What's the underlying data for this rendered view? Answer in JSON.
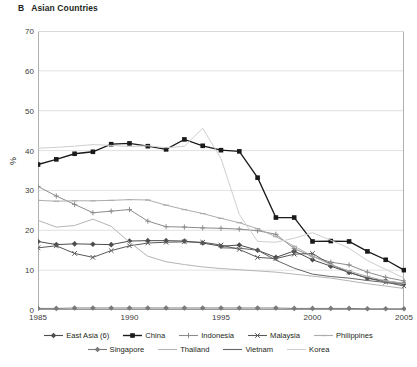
{
  "panel": {
    "letter": "B",
    "title": "Asian Countries"
  },
  "chart_data": {
    "type": "line",
    "title": "Asian Countries",
    "xlabel": "",
    "ylabel": "%",
    "xlim": [
      1985,
      2005
    ],
    "ylim": [
      0,
      70
    ],
    "ytick_values": [
      0,
      10,
      20,
      30,
      40,
      50,
      60,
      70
    ],
    "xtick_values": [
      1985,
      1990,
      1995,
      2000,
      2005
    ],
    "xtick_labels": [
      "1985",
      "1990",
      "1995",
      "2000",
      "2005"
    ],
    "grid": "horizontal",
    "legend_position": "bottom",
    "x": [
      1985,
      1986,
      1987,
      1988,
      1989,
      1990,
      1991,
      1992,
      1993,
      1994,
      1995,
      1996,
      1997,
      1998,
      1999,
      2000,
      2001,
      2002,
      2003,
      2004,
      2005
    ],
    "series": [
      {
        "name": "East Asia (6)",
        "color": "#4d4d4d",
        "marker": "diamond",
        "values": [
          17.2,
          16.4,
          16.6,
          16.5,
          16.4,
          17.3,
          17.4,
          17.4,
          17.3,
          16.8,
          16.0,
          16.3,
          15.0,
          13.2,
          14.8,
          12.6,
          11.0,
          9.4,
          8.0,
          7.3,
          6.6
        ]
      },
      {
        "name": "China",
        "color": "#1a1a1a",
        "marker": "square",
        "values": [
          36.5,
          37.8,
          39.2,
          39.7,
          41.6,
          41.8,
          41.1,
          40.3,
          42.8,
          41.2,
          40.1,
          39.8,
          33.2,
          23.2,
          23.2,
          17.2,
          17.3,
          17.2,
          14.7,
          12.6,
          10.0
        ]
      },
      {
        "name": "Indonesia",
        "color": "#8c8c8c",
        "marker": "plus",
        "values": [
          31.0,
          28.6,
          26.5,
          24.4,
          24.8,
          25.2,
          22.3,
          20.9,
          20.8,
          20.6,
          20.5,
          20.3,
          19.9,
          19.0,
          15.4,
          13.4,
          12.0,
          11.3,
          9.5,
          8.2,
          7.3
        ]
      },
      {
        "name": "Malaysia",
        "color": "#595959",
        "marker": "cross",
        "values": [
          15.6,
          16.1,
          14.2,
          13.2,
          14.9,
          16.1,
          16.8,
          17.0,
          17.1,
          17.0,
          16.3,
          15.2,
          13.2,
          12.9,
          14.0,
          14.2,
          11.4,
          9.5,
          8.0,
          7.0,
          6.0
        ]
      },
      {
        "name": "Philippines",
        "color": "#adadad",
        "marker": "dash",
        "values": [
          27.5,
          27.3,
          27.4,
          27.4,
          27.5,
          27.7,
          27.6,
          26.3,
          25.2,
          24.2,
          23.0,
          21.9,
          20.4,
          18.4,
          16.0,
          13.5,
          11.4,
          9.8,
          8.4,
          7.3,
          6.7
        ]
      },
      {
        "name": "Singapore",
        "color": "#7a7a7a",
        "marker": "diamond",
        "values": [
          0.4,
          0.4,
          0.5,
          0.5,
          0.5,
          0.5,
          0.5,
          0.5,
          0.5,
          0.5,
          0.5,
          0.5,
          0.5,
          0.5,
          0.4,
          0.4,
          0.4,
          0.4,
          0.3,
          0.3,
          0.3
        ]
      },
      {
        "name": "Thailand",
        "color": "#b5b5b5",
        "marker": "none",
        "values": [
          22.5,
          20.8,
          21.2,
          22.8,
          21.0,
          17.0,
          13.5,
          12.1,
          11.4,
          10.8,
          10.4,
          10.1,
          9.8,
          9.5,
          9.0,
          8.5,
          8.0,
          7.3,
          6.6,
          6.0,
          5.4
        ]
      },
      {
        "name": "Vietnam",
        "color": "#666666",
        "marker": "none",
        "values": [
          null,
          null,
          null,
          null,
          null,
          null,
          null,
          null,
          null,
          null,
          15.6,
          15.5,
          15.0,
          12.5,
          10.5,
          9.0,
          8.4,
          8.0,
          7.4,
          6.9,
          6.4
        ]
      },
      {
        "name": "Korea",
        "color": "#cfcfcf",
        "marker": "none",
        "values": [
          40.6,
          40.8,
          41.1,
          41.5,
          41.3,
          41.0,
          41.2,
          40.7,
          41.1,
          45.6,
          38.0,
          24.0,
          17.2,
          17.0,
          18.0,
          19.4,
          17.5,
          15.5,
          12.4,
          10.2,
          8.0
        ]
      }
    ]
  },
  "legend": {
    "row1": [
      {
        "label": "East Asia (6)"
      },
      {
        "label": "China"
      },
      {
        "label": "Indonesia"
      },
      {
        "label": "Malaysia"
      },
      {
        "label": "Philippines"
      }
    ],
    "row2": [
      {
        "label": "Singapore"
      },
      {
        "label": "Thailand"
      },
      {
        "label": "Vietnam"
      },
      {
        "label": "Korea"
      }
    ]
  }
}
